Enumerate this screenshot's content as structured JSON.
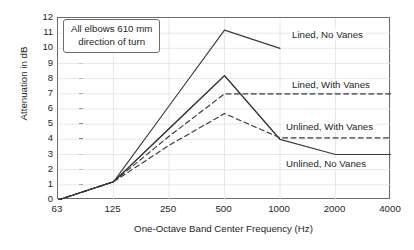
{
  "chart_data": {
    "type": "line",
    "title": "",
    "xlabel": "One-Octave Band Center Frequency (Hz)",
    "ylabel": "Attenuation in dB",
    "categories": [
      "63",
      "125",
      "250",
      "500",
      "1000",
      "2000",
      "4000"
    ],
    "x_tick_labels": [
      "63",
      "125",
      "250",
      "500",
      "1000",
      "2000",
      "4000"
    ],
    "y_tick_labels": [
      "0",
      "1",
      "2",
      "3",
      "4",
      "5",
      "6",
      "7",
      "8",
      "9",
      "10",
      "11",
      "12"
    ],
    "ylim": [
      0,
      12
    ],
    "grid": true,
    "legend": "inline-labels",
    "annotation": {
      "line1": "All elbows 610 mm",
      "line2": "direction of turn"
    },
    "series": [
      {
        "name": "Lined, No Vanes",
        "style": "solid",
        "label": "Lined, No Vanes",
        "values": [
          0,
          1.2,
          6.2,
          11.2,
          10.0,
          null,
          null
        ]
      },
      {
        "name": "Lined, With Vanes",
        "style": "solid",
        "label": "Lined, With Vanes",
        "values": [
          0,
          1.2,
          4.7,
          8.2,
          4.0,
          null,
          null
        ]
      },
      {
        "name": "Lined, With Vanes (dashed)",
        "style": "dashed",
        "label": "",
        "values": [
          0,
          1.2,
          4.2,
          7.0,
          7.0,
          7.0,
          7.0
        ]
      },
      {
        "name": "Unlined, With Vanes",
        "style": "dashed",
        "label": "Unlined, With Vanes",
        "values": [
          0,
          1.2,
          3.6,
          5.7,
          4.1,
          4.1,
          4.1
        ]
      },
      {
        "name": "Unlined, No Vanes",
        "style": "solid",
        "label": "Unlined, No Vanes",
        "values": [
          0,
          1.2,
          4.7,
          8.2,
          4.0,
          3.0,
          3.0
        ]
      }
    ],
    "curve_labels": [
      {
        "text": "Lined, No Vanes",
        "x": 290,
        "y": 29
      },
      {
        "text": "Lined, With Vanes",
        "x": 290,
        "y": 79
      },
      {
        "text": "Unlined, With Vanes",
        "x": 284,
        "y": 121
      },
      {
        "text": "Unlined, No Vanes",
        "x": 284,
        "y": 158
      }
    ]
  }
}
